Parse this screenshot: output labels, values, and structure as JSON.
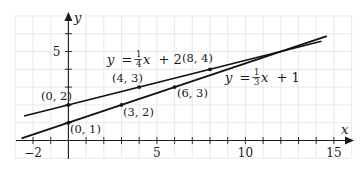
{
  "chart_data": {
    "type": "line",
    "title": "",
    "xlabel": "x",
    "ylabel": "y",
    "xlim": [
      -3,
      16
    ],
    "ylim": [
      -1,
      7
    ],
    "grid": true,
    "x_ticks": [
      -2,
      -1,
      1,
      2,
      3,
      4,
      5,
      6,
      7,
      8,
      9,
      10,
      11,
      12,
      13,
      14,
      15
    ],
    "x_tick_labels": [
      {
        "value": -2,
        "label": "−2"
      },
      {
        "value": 5,
        "label": "5"
      },
      {
        "value": 10,
        "label": "10"
      },
      {
        "value": 15,
        "label": "15"
      }
    ],
    "y_ticks": [
      1,
      2,
      3,
      4,
      5,
      6
    ],
    "y_tick_labels": [
      {
        "value": 5,
        "label": "5"
      }
    ],
    "series": [
      {
        "name": "y = 1/4 x + 2",
        "equation": {
          "lhs": "y",
          "eq": "=",
          "num": "1",
          "den": "4",
          "var": "x",
          "rest": "+ 2"
        },
        "slope": 0.25,
        "intercept": 2,
        "x_range": [
          -2.5,
          14.3
        ],
        "points": [
          {
            "x": 0,
            "y": 2,
            "label": "(0, 2)"
          },
          {
            "x": 4,
            "y": 3,
            "label": "(4, 3)"
          },
          {
            "x": 8,
            "y": 4,
            "label": "(8, 4)"
          }
        ]
      },
      {
        "name": "y = 1/3 x + 1",
        "equation": {
          "lhs": "y",
          "eq": "=",
          "num": "1",
          "den": "3",
          "var": "x",
          "rest": "+ 1"
        },
        "slope": 0.3333,
        "intercept": 1,
        "x_range": [
          -2.65,
          14.6
        ],
        "points": [
          {
            "x": 0,
            "y": 1,
            "label": "(0, 1)"
          },
          {
            "x": 3,
            "y": 2,
            "label": "(3, 2)"
          },
          {
            "x": 6,
            "y": 3,
            "label": "(6, 3)"
          }
        ]
      }
    ]
  }
}
